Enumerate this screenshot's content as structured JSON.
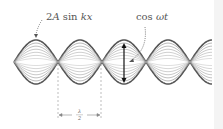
{
  "figure": {
    "type": "standing-wave-diagram",
    "labels": {
      "envelope": {
        "prefix": "2",
        "A": "A",
        "sin": " sin ",
        "kx": "kx"
      },
      "time_factor": {
        "cos": "cos ",
        "wt": "ωt"
      },
      "half_wavelength": {
        "numerator": "λ",
        "denominator": "2"
      }
    },
    "wave": {
      "x_start": 14,
      "x_end": 212,
      "center_y": 62,
      "amplitude": 22,
      "half_wavelength_px": 44,
      "envelope_levels": [
        1.0,
        0.86,
        0.72,
        0.58,
        0.44,
        0.3,
        0.16
      ],
      "colors": {
        "envelope": "#555555",
        "inner": "#9a9a9a",
        "arrow": "#111111",
        "dashed": "#9a9a9a"
      }
    },
    "markers": {
      "node_lines_x": [
        58,
        101
      ],
      "arrow_x": 124
    }
  }
}
